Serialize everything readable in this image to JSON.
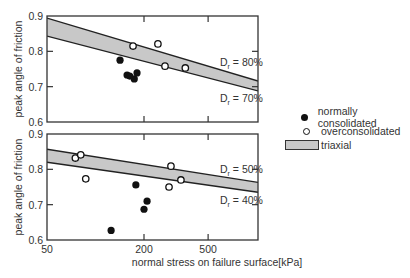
{
  "chart_data": [
    {
      "type": "scatter",
      "panel": "top",
      "xlabel": "",
      "ylabel": "peak angle of friction",
      "xscale": "log",
      "xlim": [
        50,
        1020
      ],
      "ylim": [
        0.6,
        0.9
      ],
      "yticks": [
        0.6,
        0.7,
        0.8,
        0.9
      ],
      "xticks": [
        50,
        200,
        500
      ],
      "grid": false,
      "band": {
        "name": "triaxial",
        "upper": {
          "x": [
            50,
            1020
          ],
          "y": [
            0.894,
            0.716
          ],
          "label": "Dr = 80%"
        },
        "lower": {
          "x": [
            50,
            1020
          ],
          "y": [
            0.843,
            0.688
          ],
          "label": "Dr = 70%"
        }
      },
      "series": [
        {
          "name": "normally consolidated",
          "marker": "filled",
          "points": [
            [
              142,
              0.775
            ],
            [
              157,
              0.733
            ],
            [
              163,
              0.73
            ],
            [
              174,
              0.722
            ],
            [
              181,
              0.739
            ]
          ]
        },
        {
          "name": "overconsolidated",
          "marker": "open",
          "points": [
            [
              171,
              0.815
            ],
            [
              244,
              0.821
            ],
            [
              270,
              0.758
            ],
            [
              361,
              0.753
            ]
          ]
        }
      ]
    },
    {
      "type": "scatter",
      "panel": "bottom",
      "xlabel": "normal stress on failure surface[kPa]",
      "ylabel": "peak angle of friction",
      "xscale": "log",
      "xlim": [
        50,
        1020
      ],
      "ylim": [
        0.6,
        0.9
      ],
      "yticks": [
        0.6,
        0.7,
        0.8,
        0.9
      ],
      "xticks": [
        50,
        200,
        500
      ],
      "grid": false,
      "band": {
        "name": "triaxial",
        "upper": {
          "x": [
            50,
            1020
          ],
          "y": [
            0.857,
            0.763
          ],
          "label": "Dr = 50%"
        },
        "lower": {
          "x": [
            50,
            1020
          ],
          "y": [
            0.82,
            0.735
          ],
          "label": "Dr = 40%"
        }
      },
      "series": [
        {
          "name": "normally consolidated",
          "marker": "filled",
          "points": [
            [
              178,
              0.756
            ],
            [
              209,
              0.71
            ],
            [
              200,
              0.687
            ],
            [
              125,
              0.627
            ]
          ]
        },
        {
          "name": "overconsolidated",
          "marker": "open",
          "points": [
            [
              75,
              0.832
            ],
            [
              81,
              0.841
            ],
            [
              87,
              0.773
            ],
            [
              294,
              0.809
            ],
            [
              286,
              0.75
            ],
            [
              339,
              0.77
            ]
          ]
        }
      ]
    }
  ],
  "axes": {
    "ylabel": "peak angle of friction",
    "xlabel": "normal stress on failure surface[kPa]",
    "ytick_labels": [
      "0.9",
      "0.8",
      "0.7",
      "0.6"
    ],
    "xtick_labels": [
      "50",
      "200",
      "500"
    ]
  },
  "annotations": {
    "top_upper": {
      "base": "D",
      "sub": "r",
      "rest": " = 80%"
    },
    "top_lower": {
      "base": "D",
      "sub": "r",
      "rest": " = 70%"
    },
    "bottom_upper": {
      "base": "D",
      "sub": "r",
      "rest": " = 50%"
    },
    "bottom_lower": {
      "base": "D",
      "sub": "r",
      "rest": " = 40%"
    }
  },
  "legend": {
    "items": [
      {
        "label": "normally consolidated",
        "symbol": "filled-circle"
      },
      {
        "label": "overconsolidated",
        "symbol": "open-circle"
      },
      {
        "label": "triaxial",
        "symbol": "gray-band"
      }
    ]
  },
  "colors": {
    "axis": "#333333",
    "band_fill": "#c8c8c8",
    "band_line": "#222222",
    "marker": "#111111",
    "text": "#333333"
  }
}
